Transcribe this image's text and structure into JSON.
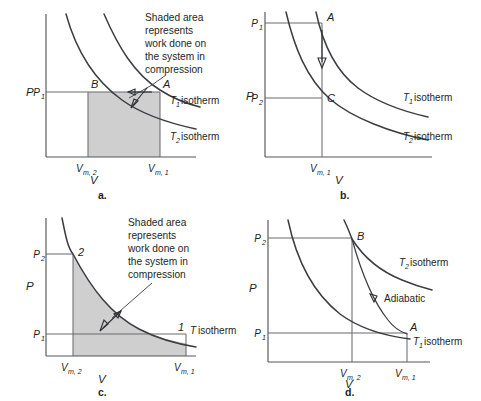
{
  "figure": {
    "type": "pressure-volume-diagrams",
    "panel_count": 4,
    "colors": {
      "shade": "#cfcfcf",
      "curve": "#3b3c40",
      "axis": "#55565a",
      "text": "#1e1f22"
    }
  },
  "panels": {
    "a": {
      "label": "a.",
      "axis_x_label": "V",
      "axis_y_label": "P",
      "y_ticks": [
        "P",
        "1"
      ],
      "y_tick_text": "P",
      "y_tick_sub": "1",
      "x_ticks": [
        {
          "text": "V",
          "sub": "m, 2"
        },
        {
          "text": "V",
          "sub": "m, 1"
        }
      ],
      "points": [
        "B",
        "A"
      ],
      "point_b": "B",
      "point_a": "A",
      "isotherms": [
        {
          "symbol": "T",
          "sub": "1",
          "text": "isotherm"
        },
        {
          "symbol": "T",
          "sub": "2",
          "text": "isotherm"
        }
      ],
      "note": [
        "Shaded area",
        "represents",
        "work done on",
        "the system in",
        "compression"
      ]
    },
    "b": {
      "label": "b.",
      "axis_x_label": "V",
      "axis_y_label": "P",
      "y_ticks": [
        {
          "text": "P",
          "sub": "1"
        },
        {
          "text": "P",
          "sub": "2"
        }
      ],
      "x_ticks": [
        {
          "text": "V",
          "sub": "m, 1"
        }
      ],
      "points": [
        "A",
        "C"
      ],
      "point_a": "A",
      "point_c": "C",
      "isotherms": [
        {
          "symbol": "T",
          "sub": "1",
          "text": "isotherm"
        },
        {
          "symbol": "T",
          "sub": "2",
          "text": "isotherm"
        }
      ]
    },
    "c": {
      "label": "c.",
      "axis_x_label": "V",
      "axis_y_label": "P",
      "y_ticks": [
        {
          "text": "P",
          "sub": "2"
        },
        {
          "text": "P",
          "sub": "1"
        }
      ],
      "x_ticks": [
        {
          "text": "V",
          "sub": "m, 2"
        },
        {
          "text": "V",
          "sub": "m, 1"
        }
      ],
      "points": [
        "2",
        "1"
      ],
      "point_2": "2",
      "point_1": "1",
      "isotherms": [
        {
          "symbol": "T",
          "sub": "",
          "text": "isotherm"
        }
      ],
      "note": [
        "Shaded area",
        "represents",
        "work done on",
        "the system in",
        "compression"
      ]
    },
    "d": {
      "label": "d.",
      "axis_x_label": "V",
      "axis_y_label": "P",
      "y_ticks": [
        {
          "text": "P",
          "sub": "2"
        },
        {
          "text": "P",
          "sub": "1"
        }
      ],
      "x_ticks": [
        {
          "text": "V",
          "sub": "m, 2"
        },
        {
          "text": "V",
          "sub": "m, 1"
        }
      ],
      "points": [
        "B",
        "A"
      ],
      "point_b": "B",
      "point_a": "A",
      "isotherms": [
        {
          "symbol": "T",
          "sub": "2",
          "text": "isotherm"
        },
        {
          "symbol": "T",
          "sub": "1",
          "text": "isotherm"
        }
      ],
      "adiabatic_label": "Adiabatic"
    }
  },
  "text_atoms": {
    "P": "P",
    "V": "V",
    "T": "T",
    "one": "1",
    "two": "2",
    "A": "A",
    "B": "B",
    "C": "C",
    "isotherm": "isotherm",
    "sub_m1": "m, 1",
    "sub_m2": "m, 2",
    "adiabatic": "Adiabatic",
    "note_l1": "Shaded area",
    "note_l2": "represents",
    "note_l3": "work done on",
    "note_l4": "the system in",
    "note_l5": "compression",
    "label_a": "a.",
    "label_b": "b.",
    "label_c": "c.",
    "label_d": "d."
  }
}
